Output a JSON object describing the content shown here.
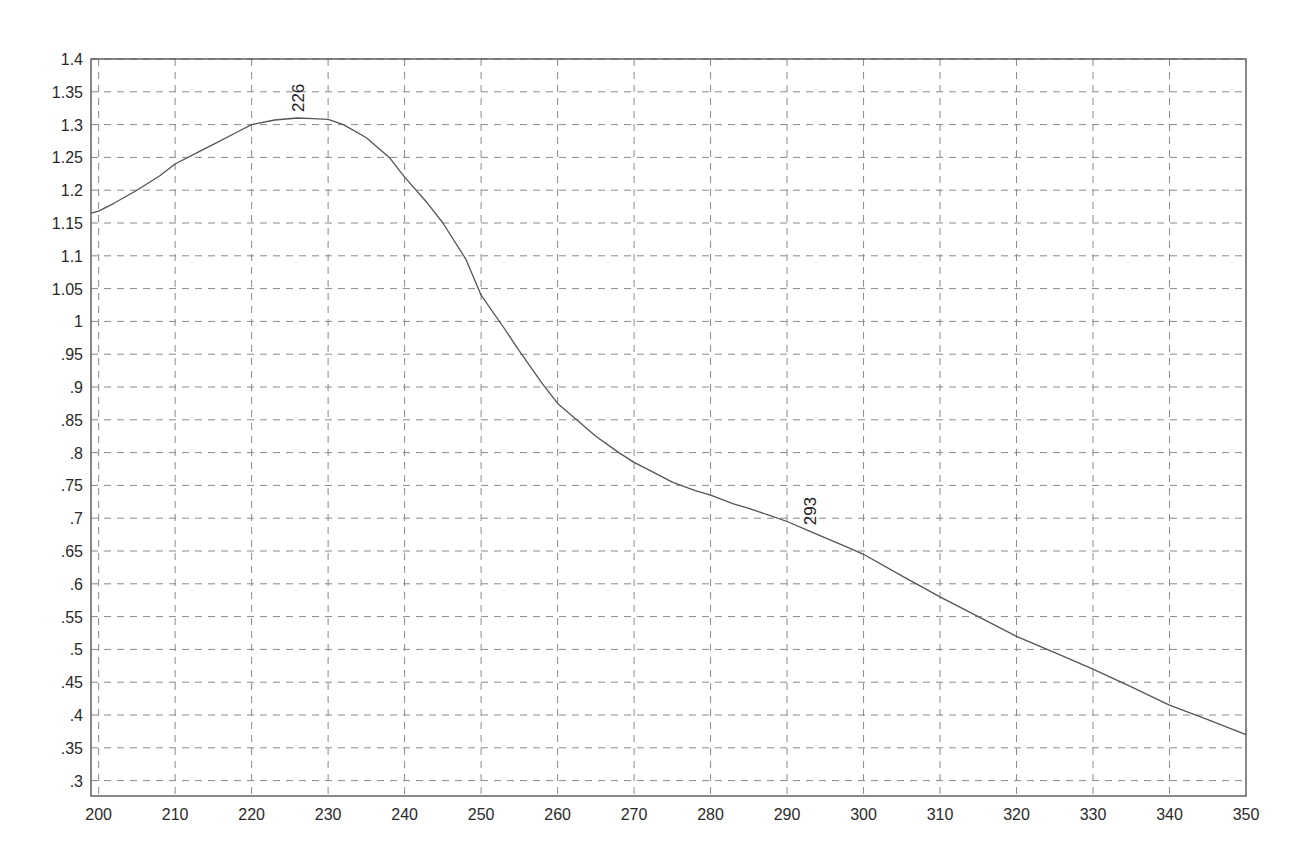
{
  "chart_data": {
    "type": "line",
    "title": "",
    "xlabel": "",
    "ylabel": "",
    "xlim": [
      199,
      350
    ],
    "ylim": [
      0.275,
      1.4
    ],
    "grid": true,
    "grid_style": "dashed",
    "legend": null,
    "x_ticks": [
      200,
      210,
      220,
      230,
      240,
      250,
      260,
      270,
      280,
      290,
      300,
      310,
      320,
      330,
      340,
      350
    ],
    "x_tick_labels": [
      "200",
      "210",
      "220",
      "230",
      "240",
      "250",
      "260",
      "270",
      "280",
      "290",
      "300",
      "310",
      "320",
      "330",
      "340",
      "350"
    ],
    "y_ticks": [
      1.4,
      1.35,
      1.3,
      1.25,
      1.2,
      1.15,
      1.1,
      1.05,
      1.0,
      0.95,
      0.9,
      0.85,
      0.8,
      0.75,
      0.7,
      0.65,
      0.6,
      0.55,
      0.5,
      0.45,
      0.4,
      0.35,
      0.3
    ],
    "y_tick_labels": [
      "1.4",
      "1.35",
      "1.3",
      "1.25",
      "1.2",
      "1.15",
      "1.1",
      "1.05",
      "1",
      ".95",
      ".9",
      ".85",
      ".8",
      ".75",
      ".7",
      ".65",
      ".6",
      ".55",
      ".5",
      ".45",
      ".4",
      ".35",
      ".3"
    ],
    "series": [
      {
        "name": "spectrum",
        "color": "#555555",
        "x": [
          199,
          200,
          202,
          205,
          208,
          210,
          213,
          215,
          218,
          220,
          223,
          226,
          228,
          230,
          232,
          235,
          238,
          240,
          243,
          245,
          248,
          250,
          253,
          255,
          258,
          260,
          263,
          265,
          268,
          270,
          273,
          275,
          278,
          280,
          283,
          285,
          288,
          290,
          293,
          295,
          298,
          300,
          305,
          310,
          315,
          320,
          325,
          330,
          335,
          340,
          345,
          350
        ],
        "values": [
          1.165,
          1.168,
          1.18,
          1.2,
          1.222,
          1.24,
          1.258,
          1.27,
          1.288,
          1.3,
          1.307,
          1.31,
          1.309,
          1.308,
          1.3,
          1.28,
          1.25,
          1.22,
          1.18,
          1.15,
          1.095,
          1.04,
          0.99,
          0.955,
          0.905,
          0.875,
          0.845,
          0.825,
          0.8,
          0.785,
          0.767,
          0.755,
          0.742,
          0.735,
          0.722,
          0.715,
          0.703,
          0.695,
          0.68,
          0.67,
          0.655,
          0.645,
          0.612,
          0.58,
          0.55,
          0.52,
          0.495,
          0.47,
          0.443,
          0.415,
          0.393,
          0.37
        ]
      }
    ],
    "annotations": [
      {
        "text": "226",
        "x": 226,
        "y": 1.31,
        "rotation": -90
      },
      {
        "text": "293",
        "x": 293,
        "y": 0.68,
        "rotation": -90
      }
    ]
  },
  "colors": {
    "axis": "#555555",
    "grid": "#8a8a8a",
    "line": "#555555",
    "text": "#2a2a2a",
    "background": "#ffffff"
  }
}
